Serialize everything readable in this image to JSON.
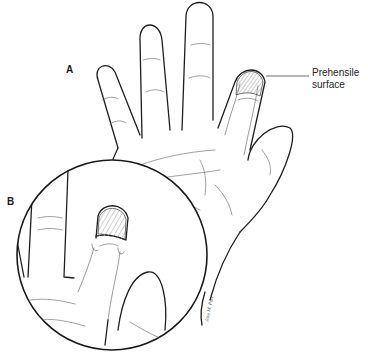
{
  "figure": {
    "labels": {
      "panel_a": "A",
      "panel_b": "B",
      "prehensile_line1": "Prehensile",
      "prehensile_line2": "surface"
    },
    "signature": "Jose M. Pore",
    "colors": {
      "line": "#1e1e1e",
      "hatch": "#555555",
      "background": "#ffffff"
    }
  }
}
